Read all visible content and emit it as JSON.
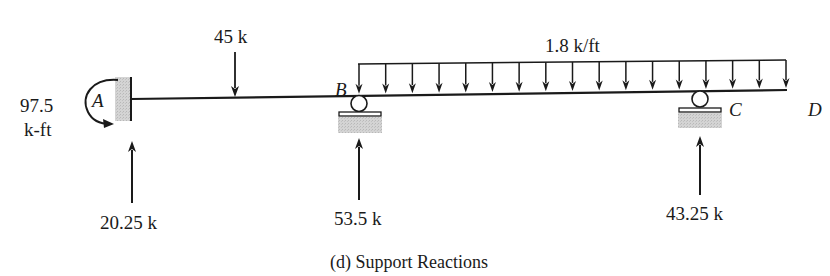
{
  "figure": {
    "caption": "(d) Support Reactions"
  },
  "beam": {
    "points": [
      {
        "id": "A",
        "label": "A"
      },
      {
        "id": "B",
        "label": "B"
      },
      {
        "id": "C",
        "label": "C"
      },
      {
        "id": "D",
        "label": "D"
      }
    ]
  },
  "loads": {
    "point_load": {
      "label": "45 k"
    },
    "distributed_load": {
      "label": "1.8 k/ft",
      "arrow_count": 17
    }
  },
  "reactions": {
    "moment_A": {
      "value": "97.5",
      "unit": "k-ft"
    },
    "vertical_A": {
      "label": "20.25 k"
    },
    "vertical_B": {
      "label": "53.5 k"
    },
    "vertical_C": {
      "label": "43.25 k"
    }
  },
  "colors": {
    "line": "#1a1a1a",
    "support_fill": "#cfcfcf"
  }
}
